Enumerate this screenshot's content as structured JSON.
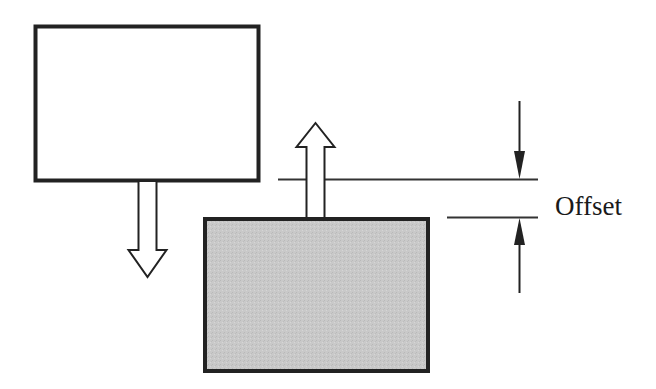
{
  "diagram": {
    "type": "offset-illustration",
    "label": "Offset",
    "elements": {
      "upper_block": {
        "fill": "#ffffff",
        "stroke": "#222222",
        "x": 34,
        "y": 25,
        "width": 226,
        "height": 157
      },
      "lower_block": {
        "fill": "#c8c8c8",
        "stroke": "#222222",
        "x": 203,
        "y": 217,
        "width": 227,
        "height": 156
      },
      "down_arrow": {
        "style": "hollow",
        "direction": "down"
      },
      "up_arrow": {
        "style": "hollow",
        "direction": "up"
      },
      "dimension": {
        "upper_reference_y": 179,
        "lower_reference_y": 217,
        "label": "Offset"
      }
    },
    "colors": {
      "line": "#222222",
      "shaded_fill": "#c8c8c8",
      "background": "#ffffff"
    }
  }
}
